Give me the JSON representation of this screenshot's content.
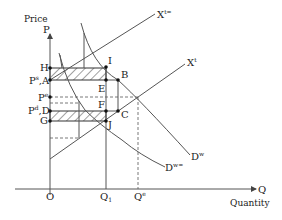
{
  "diagram": {
    "y_axis": {
      "title": "Price",
      "symbol": "P"
    },
    "x_axis": {
      "title": "Quantity",
      "symbol": "Q"
    },
    "origin_label": "O",
    "price_labels": {
      "H": "H",
      "A": "P",
      "A_sup": "s",
      "A_suffix": ",A",
      "Pe": "P",
      "Pe_sup": "e",
      "D": "P",
      "D_sup": "d",
      "D_suffix": ",D",
      "G": "G"
    },
    "points": {
      "I": "I",
      "B": "B",
      "E": "E",
      "F": "F",
      "C": "C",
      "J": "J"
    },
    "quantity_labels": {
      "Q1": "Q",
      "Q1_sub": "1",
      "Qe": "Q",
      "Qe_sup": "e"
    },
    "curves": {
      "supply_shifted": {
        "label": "X",
        "sup": "t="
      },
      "supply": {
        "label": "X",
        "sup": "t"
      },
      "demand": {
        "label": "D",
        "sup": "w"
      },
      "demand_shifted": {
        "label": "D",
        "sup": "w="
      }
    },
    "colors": {
      "line": "#555555",
      "hatch": "#444444",
      "point": "#111111"
    }
  }
}
